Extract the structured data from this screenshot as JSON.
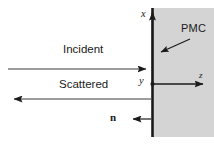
{
  "figure": {
    "name": "pmc-scattering-diagram",
    "background_color": "#ffffff",
    "line_color": "#1a1a1a",
    "wall_color": "#1a1a1a",
    "medium_fill_color": "#d4d4d4",
    "width": 214,
    "height": 148
  },
  "labels": {
    "incident": "Incident",
    "scattered": "Scattered",
    "pmc": "PMC",
    "axis_x": "x",
    "axis_y": "y",
    "axis_z": "z",
    "normal": "n",
    "normal_hat": "^"
  },
  "geometry": {
    "wall_x": 152,
    "origin_x": 152,
    "origin_y": 84,
    "wall_top_y": 8,
    "wall_bottom_y": 137,
    "medium_left_x": 152,
    "medium_right_x": 214,
    "medium_top_y": 8,
    "medium_bottom_y": 137,
    "incident_arrow_y": 69,
    "incident_arrow_x_start": 8,
    "incident_arrow_x_end": 151,
    "scattered_arrow_y": 99,
    "scattered_arrow_x_start": 151,
    "scattered_arrow_x_end": 8,
    "z_axis_x_end": 209,
    "x_axis_y_end": 6,
    "normal_arrow_y": 119,
    "normal_arrow_x_start": 151,
    "normal_arrow_x_end": 127,
    "pmc_leader_start_x": 190,
    "pmc_leader_start_y": 39,
    "pmc_leader_end_x": 156,
    "pmc_leader_end_y": 54
  }
}
